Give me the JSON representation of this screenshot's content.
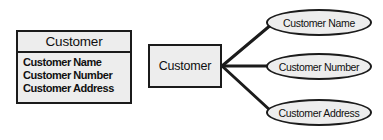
{
  "diagram": {
    "style": {
      "fill": "#ededed",
      "stroke": "#1b1b1b",
      "background": "#ffffff",
      "text": "#101010"
    },
    "table_notation": {
      "header": "Customer",
      "attributes": [
        "Customer Name",
        "Customer Number",
        "Customer Address"
      ]
    },
    "er_notation": {
      "entity": "Customer",
      "attributes": [
        "Customer Name",
        "Customer Number",
        "Customer Address"
      ],
      "connectors": [
        {
          "from": "entity",
          "to": "Customer Name"
        },
        {
          "from": "entity",
          "to": "Customer Number"
        },
        {
          "from": "entity",
          "to": "Customer Address"
        }
      ]
    }
  }
}
